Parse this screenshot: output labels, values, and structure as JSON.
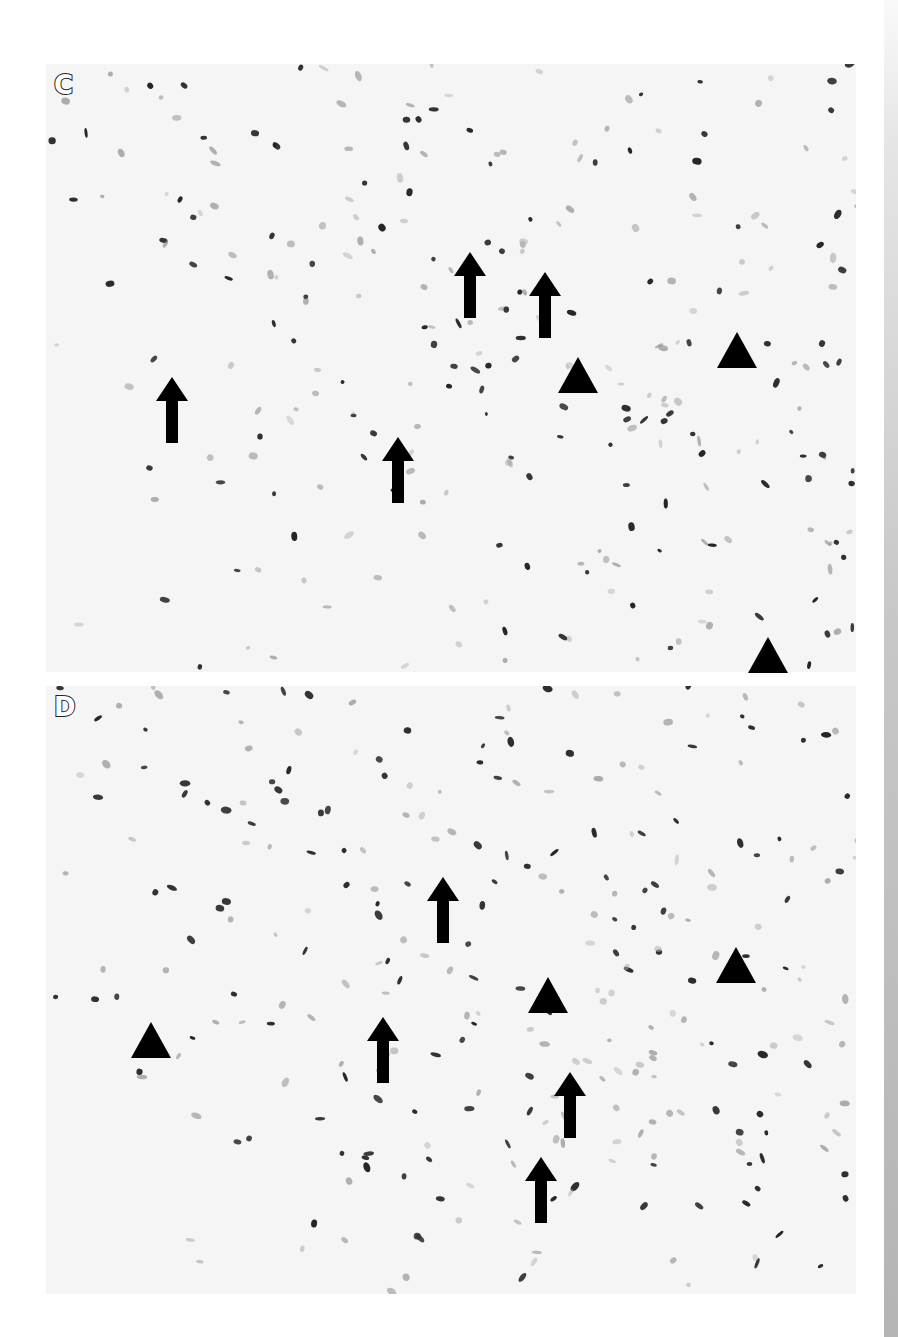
{
  "figure": {
    "panels": [
      {
        "id": "C",
        "label": "C",
        "content": "histology micrograph, immunostained nuclei",
        "markers": {
          "arrows": [
            {
              "x": 470,
              "y": 285
            },
            {
              "x": 545,
              "y": 305
            },
            {
              "x": 172,
              "y": 410
            },
            {
              "x": 398,
              "y": 470
            }
          ],
          "arrowheads": [
            {
              "x": 578,
              "y": 375
            },
            {
              "x": 737,
              "y": 350
            },
            {
              "x": 768,
              "y": 655
            }
          ]
        }
      },
      {
        "id": "D",
        "label": "D",
        "content": "histology micrograph, immunostained nuclei",
        "markers": {
          "arrows": [
            {
              "x": 443,
              "y": 910
            },
            {
              "x": 383,
              "y": 1050
            },
            {
              "x": 570,
              "y": 1105
            },
            {
              "x": 541,
              "y": 1190
            }
          ],
          "arrowheads": [
            {
              "x": 151,
              "y": 1040
            },
            {
              "x": 548,
              "y": 995
            },
            {
              "x": 736,
              "y": 965
            }
          ]
        }
      }
    ],
    "colors": {
      "background": "#ffffff",
      "tissue_bg": "#f5f5f5",
      "nucleus_dark": "#1a1a1a",
      "nucleus_light": "#8a8a8a",
      "marker": "#000000"
    }
  }
}
